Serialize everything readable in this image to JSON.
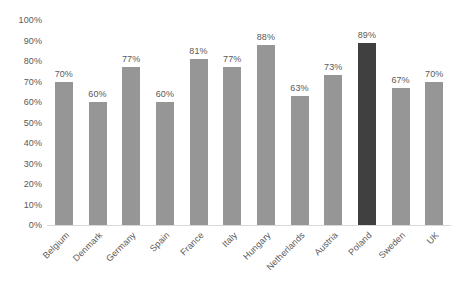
{
  "chart_data": {
    "type": "bar",
    "title": "",
    "xlabel": "",
    "ylabel": "",
    "ylim": [
      0,
      100
    ],
    "grid": false,
    "legend": "none",
    "value_suffix": "%",
    "categories": [
      "Belgium",
      "Denmark",
      "Germany",
      "Spain",
      "France",
      "Italy",
      "Hungary",
      "Netherlands",
      "Austria",
      "Poland",
      "Sweden",
      "UK"
    ],
    "values": [
      70,
      60,
      77,
      60,
      81,
      77,
      88,
      63,
      73,
      89,
      67,
      70
    ],
    "data_labels": [
      "70%",
      "60%",
      "77%",
      "60%",
      "81%",
      "77%",
      "88%",
      "63%",
      "73%",
      "89%",
      "67%",
      "70%"
    ],
    "highlight_category": "Poland",
    "highlight_index": 9,
    "y_ticks": [
      0,
      10,
      20,
      30,
      40,
      50,
      60,
      70,
      80,
      90,
      100
    ],
    "y_tick_labels": [
      "0%",
      "10%",
      "20%",
      "30%",
      "40%",
      "50%",
      "60%",
      "70%",
      "80%",
      "90%",
      "100%"
    ],
    "colors": {
      "bar": "#969696",
      "highlight_bar": "#404040",
      "text": "#595959",
      "baseline": "#d9d9d9",
      "background": "#ffffff"
    }
  }
}
